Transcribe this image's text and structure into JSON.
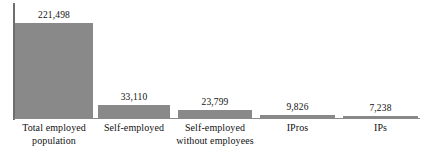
{
  "chart_data": {
    "type": "bar",
    "title": "",
    "subtitle": "",
    "xlabel": "",
    "ylabel": "",
    "grid": false,
    "legend": "none",
    "axis": {
      "y_axis_visible": true,
      "x_axis_visible": true,
      "y_tick_labels": [],
      "ylim": [
        0,
        230000
      ]
    },
    "bar_color": "#898989",
    "text_color": "#111111",
    "axis_color": "#6e6e6e",
    "categories": [
      "Total employed population",
      "Self-employed",
      "Self-employed without employees",
      "IPros",
      "IPs"
    ],
    "category_lines": [
      [
        "Total employed",
        "population"
      ],
      [
        "Self-employed"
      ],
      [
        "Self-employed",
        "without employees"
      ],
      [
        "IPros"
      ],
      [
        "IPs"
      ]
    ],
    "values": [
      221498,
      33110,
      23799,
      9826,
      7238
    ],
    "value_labels": [
      "221,498",
      "33,110",
      "23,799",
      "9,826",
      "7,238"
    ],
    "bars": [
      {
        "name": "total-employed-population",
        "left": 15,
        "width": 78,
        "height_px": 96,
        "value_label": "221,498"
      },
      {
        "name": "self-employed",
        "left": 98,
        "width": 72,
        "height_px": 14,
        "value_label": "33,110"
      },
      {
        "name": "self-employed-without-employees",
        "left": 178,
        "width": 74,
        "height_px": 9,
        "value_label": "23,799"
      },
      {
        "name": "ipros",
        "left": 260,
        "width": 75,
        "height_px": 4,
        "value_label": "9,826"
      },
      {
        "name": "ips",
        "left": 343,
        "width": 75,
        "height_px": 3,
        "value_label": "7,238"
      }
    ],
    "category_label_boxes": [
      {
        "left": 12,
        "width": 84
      },
      {
        "left": 96,
        "width": 76
      },
      {
        "left": 172,
        "width": 86
      },
      {
        "left": 260,
        "width": 75
      },
      {
        "left": 343,
        "width": 75
      }
    ]
  }
}
